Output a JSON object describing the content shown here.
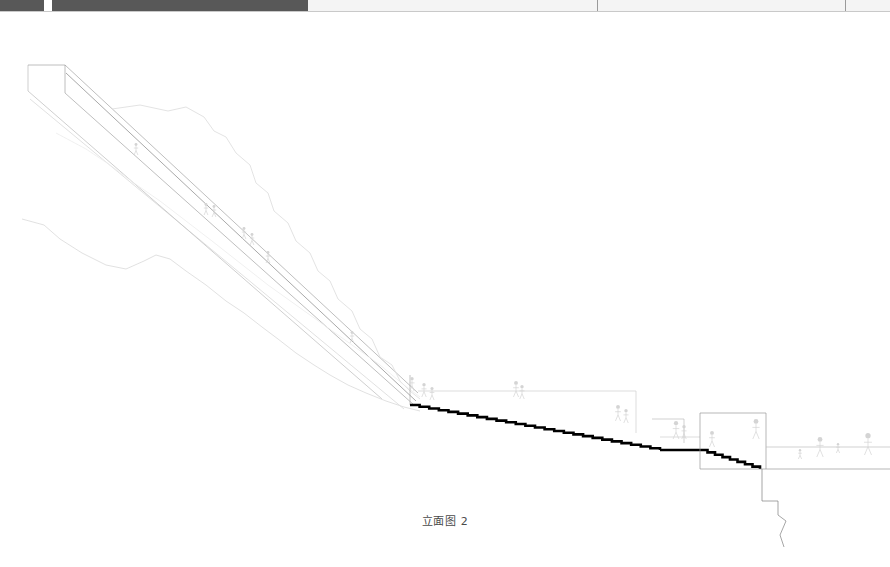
{
  "document": {
    "title": "立面图 2",
    "caption": "立面图 2",
    "drawing_type": "architectural-elevation"
  },
  "header": {
    "dark_band_color": "#585858",
    "light_band_color": "#f4f4f4",
    "rule_color": "#c9c9c9",
    "tick_color": "#9a9a9a",
    "dark_segments": [
      {
        "left": 0,
        "width": 44
      },
      {
        "left": 52,
        "width": 256
      }
    ],
    "light_segment": {
      "left": 308,
      "width": 582
    },
    "ticks": [
      597,
      845
    ]
  },
  "palette": {
    "paper": "#ffffff",
    "bold_stroke": "#000000",
    "medium_stroke": "#555555",
    "light_stroke": "#b9b9b9",
    "faint_stroke": "#e2e2e2",
    "figure_stroke": "#d4d4d4",
    "caption_text": "#4a4a4a"
  },
  "drawing": {
    "elements": [
      {
        "name": "upper-ramp-band",
        "label": "Upper inclined ramp band",
        "kind": "polyline",
        "stroke": "#8a8a8a",
        "stroke_width": 0.55,
        "points": "28,52 65,52 418,380"
      },
      {
        "name": "upper-ramp-band-inner",
        "label": "Upper inclined ramp inner edge",
        "kind": "polyline",
        "stroke": "#9e9e9e",
        "stroke_width": 0.5,
        "points": "28,52 28,78 382,386"
      },
      {
        "name": "lower-ramp-band",
        "label": "Lower inclined ramp band",
        "kind": "polyline",
        "stroke": "#8a8a8a",
        "stroke_width": 0.55,
        "points": "65,52 65,80 414,392"
      },
      {
        "name": "ramp-deck-line",
        "label": "Ramp deck line",
        "kind": "polyline",
        "stroke": "#6f6f6f",
        "stroke_width": 0.6,
        "points": "66,60 416,388"
      },
      {
        "name": "ramp-soffit-line",
        "label": "Ramp soffit line",
        "kind": "polyline",
        "stroke": "#c2c2c2",
        "stroke_width": 0.5,
        "points": "30,86 404,396"
      },
      {
        "name": "terrain-upper-contour",
        "label": "Upper terrain contour",
        "kind": "polyline",
        "stroke": "#e0e0e0",
        "stroke_width": 0.9,
        "points": "112,96 140,92 168,98 186,94 204,104 214,118 226,124 236,140 250,152 256,170 268,180 274,198 288,210 296,228 310,240 318,258 330,268 338,286 352,298 360,316 372,326 380,344 392,352 400,368 410,378 420,386"
      },
      {
        "name": "terrain-lower-contour",
        "label": "Lower terrain contour",
        "kind": "polyline",
        "stroke": "#dedede",
        "stroke_width": 0.9,
        "points": "22,206 44,212 60,226 82,240 106,252 126,256 144,248 156,242 170,246 186,258 206,272 226,288 244,300 262,314 278,326 296,340 314,352 330,362 348,372 366,380 386,388 404,394 420,398"
      },
      {
        "name": "terrain-mid-contour",
        "label": "Mid terrain contour",
        "kind": "polyline",
        "stroke": "#ececec",
        "stroke_width": 0.8,
        "points": "56,120 86,136 110,152 134,170 160,188 186,208 212,228 240,250 268,272 296,292 324,312 352,332 380,352 404,372 420,384"
      },
      {
        "name": "ramp-terminus-wall",
        "label": "Ramp terminus wall",
        "kind": "polyline",
        "stroke": "#9a9a9a",
        "stroke_width": 0.6,
        "points": "410,362 410,392"
      },
      {
        "name": "stair-run-upper",
        "label": "Bold stepped stair profile (upper run)",
        "kind": "stair",
        "stroke": "#000000",
        "stroke_width": 2.6,
        "x0": 410,
        "y0": 392,
        "x1": 660,
        "y1": 437,
        "steps": 26
      },
      {
        "name": "stair-landing",
        "label": "Intermediate landing",
        "kind": "polyline",
        "stroke": "#000000",
        "stroke_width": 2.6,
        "points": "660,437 700,437"
      },
      {
        "name": "stair-run-lower",
        "label": "Bold stepped stair profile (lower run)",
        "kind": "stair",
        "stroke": "#000000",
        "stroke_width": 2.6,
        "x0": 700,
        "y0": 437,
        "x1": 760,
        "y1": 456,
        "steps": 8
      },
      {
        "name": "guard-rail-upper",
        "label": "Guard rail above upper stair run",
        "kind": "polyline",
        "stroke": "#cfcfcf",
        "stroke_width": 0.7,
        "points": "418,378 636,378 636,420"
      },
      {
        "name": "guard-rail-lower",
        "label": "Guard rail above lower stair run",
        "kind": "polyline",
        "stroke": "#cfcfcf",
        "stroke_width": 0.7,
        "points": "660,424 700,424"
      },
      {
        "name": "platform-building",
        "label": "Terminal platform / building block",
        "kind": "polyline",
        "stroke": "#9a9a9a",
        "stroke_width": 0.7,
        "points": "700,400 766,400 766,456 700,456 700,400"
      },
      {
        "name": "platform-deck",
        "label": "Lower terrace deck line",
        "kind": "polyline",
        "stroke": "#bdbdbd",
        "stroke_width": 0.7,
        "points": "766,434 890,434"
      },
      {
        "name": "platform-deck-base",
        "label": "Lower terrace base line",
        "kind": "polyline",
        "stroke": "#9a9a9a",
        "stroke_width": 0.7,
        "points": "766,456 890,456"
      },
      {
        "name": "retaining-wall-descent",
        "label": "Retaining wall descending below terrace",
        "kind": "polyline",
        "stroke": "#7f7f7f",
        "stroke_width": 0.7,
        "points": "762,456 762,488 778,488 778,502 786,508 780,522 784,534"
      },
      {
        "name": "lower-left-wall",
        "label": "Small wall left of platform",
        "kind": "polyline",
        "stroke": "#b4b4b4",
        "stroke_width": 0.6,
        "points": "652,406 684,406 684,430"
      }
    ],
    "figures": [
      {
        "name": "figure-ramp-1",
        "x": 136,
        "y": 130,
        "h": 12
      },
      {
        "name": "figure-ramp-2",
        "x": 206,
        "y": 190,
        "h": 12
      },
      {
        "name": "figure-ramp-3",
        "x": 214,
        "y": 192,
        "h": 12
      },
      {
        "name": "figure-ramp-4",
        "x": 244,
        "y": 214,
        "h": 12
      },
      {
        "name": "figure-ramp-5",
        "x": 252,
        "y": 220,
        "h": 12
      },
      {
        "name": "figure-ramp-6",
        "x": 268,
        "y": 238,
        "h": 12
      },
      {
        "name": "figure-ramp-7",
        "x": 352,
        "y": 318,
        "h": 12
      },
      {
        "name": "figure-ramp-8",
        "x": 412,
        "y": 364,
        "h": 14
      },
      {
        "name": "figure-ramp-9",
        "x": 424,
        "y": 370,
        "h": 14
      },
      {
        "name": "figure-ramp-10",
        "x": 432,
        "y": 374,
        "h": 13
      },
      {
        "name": "figure-stair-1",
        "x": 516,
        "y": 368,
        "h": 16
      },
      {
        "name": "figure-stair-2",
        "x": 522,
        "y": 372,
        "h": 14
      },
      {
        "name": "figure-stair-3",
        "x": 618,
        "y": 392,
        "h": 16
      },
      {
        "name": "figure-stair-4",
        "x": 626,
        "y": 396,
        "h": 14
      },
      {
        "name": "figure-terrace-1",
        "x": 676,
        "y": 408,
        "h": 18
      },
      {
        "name": "figure-terrace-2",
        "x": 684,
        "y": 412,
        "h": 14
      },
      {
        "name": "figure-terrace-3",
        "x": 712,
        "y": 418,
        "h": 16
      },
      {
        "name": "figure-terrace-4",
        "x": 756,
        "y": 406,
        "h": 20
      },
      {
        "name": "figure-terrace-5",
        "x": 800,
        "y": 436,
        "h": 10
      },
      {
        "name": "figure-terrace-6",
        "x": 820,
        "y": 424,
        "h": 20
      },
      {
        "name": "figure-terrace-7",
        "x": 838,
        "y": 430,
        "h": 10
      },
      {
        "name": "figure-terrace-8",
        "x": 868,
        "y": 420,
        "h": 22
      }
    ]
  }
}
